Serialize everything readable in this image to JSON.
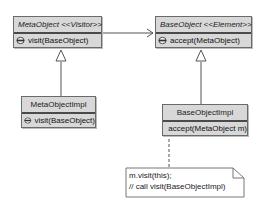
{
  "diagram": {
    "type": "uml-class",
    "classes": [
      {
        "id": "metaobject",
        "name": "MetaObject <<Visitor>>",
        "abstract": true,
        "operations": [
          "visit(BaseObject)"
        ]
      },
      {
        "id": "baseobject",
        "name": "BaseObject <<Element>>",
        "abstract": true,
        "operations": [
          "accept(MetaObject)"
        ]
      },
      {
        "id": "metaobjectimpl",
        "name": "MetaObjectImpl",
        "abstract": false,
        "operations": [
          "visit(BaseObject)"
        ]
      },
      {
        "id": "baseobjectimpl",
        "name": "BaseObjectImpl",
        "abstract": false,
        "operations": [
          "accept(MetaObject m)"
        ]
      }
    ],
    "relations": [
      {
        "from": "metaobject",
        "to": "baseobject",
        "type": "association"
      },
      {
        "from": "metaobjectimpl",
        "to": "metaobject",
        "type": "generalization"
      },
      {
        "from": "baseobjectimpl",
        "to": "baseobject",
        "type": "generalization"
      },
      {
        "from": "note",
        "to": "baseobjectimpl",
        "type": "anchor"
      }
    ],
    "note": {
      "lines": [
        "m.visit(this);",
        "// call visit(BaseObjectImpl)"
      ]
    }
  },
  "colors": {
    "class_fill": "#d8d8d8",
    "border": "#6a6a6a",
    "line": "#555555"
  }
}
